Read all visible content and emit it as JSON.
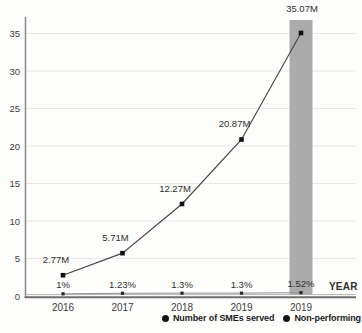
{
  "chart_data": {
    "type": "line",
    "title": "",
    "xlabel": "YEAR",
    "ylabel": "",
    "ylim": [
      0,
      35
    ],
    "yticks": [
      0,
      5,
      10,
      15,
      20,
      25,
      30,
      35
    ],
    "grid": true,
    "legend_position": "bottom-right",
    "categories": [
      "2016",
      "2017",
      "2018",
      "2019",
      "2019"
    ],
    "series": [
      {
        "name": "Number of SMEs served",
        "values": [
          2.77,
          5.71,
          12.27,
          20.87,
          35.07
        ],
        "labels": [
          "2.77M",
          "5.71M",
          "12.27M",
          "20.87M",
          "35.07M"
        ],
        "color": "#4a4a4a",
        "marker_color": "#111111"
      },
      {
        "name": "Non-performing",
        "values": [
          1,
          1.23,
          1.3,
          1.3,
          1.52
        ],
        "labels": [
          "1%",
          "1.23%",
          "1.3%",
          "1.3%",
          "1.52%"
        ],
        "color": "#909090",
        "marker_color": "#2a2a2a"
      }
    ],
    "highlight": {
      "category_index": 4,
      "color": "#ababab"
    },
    "colors": {
      "gridline": "#e8e8e8",
      "axis": "#6e6e6e",
      "axis_light": "#b5b5b5",
      "tick_text": "#3d3d3d",
      "label_text": "#2e2e2e"
    }
  }
}
